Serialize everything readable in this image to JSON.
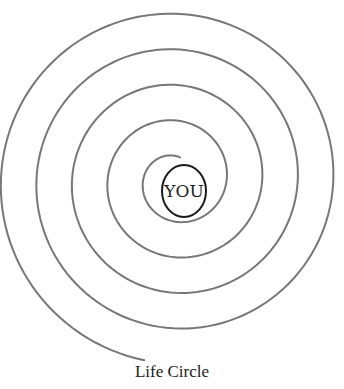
{
  "diagram": {
    "type": "spiral",
    "center_label": "YOU",
    "caption": "Life Circle",
    "colors": {
      "spiral_stroke": "#777777",
      "center_circle_stroke": "#1a1a1a",
      "text": "#222222",
      "background": "#ffffff"
    },
    "spiral": {
      "cx": 176,
      "cy": 180,
      "r_start": 23,
      "r_end": 183,
      "turns": 4.5,
      "start_angle_deg": -80
    },
    "center_circle": {
      "cx": 184,
      "cy": 191,
      "rx": 22,
      "ry": 26
    }
  }
}
